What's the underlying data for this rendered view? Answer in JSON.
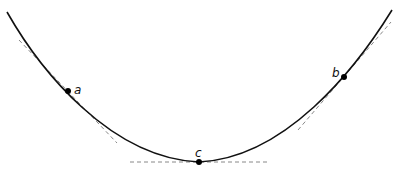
{
  "diagram": {
    "type": "convex-curve-with-tangents",
    "colors": {
      "curve": "#111111",
      "tangent": "#888888",
      "point": "#000000",
      "background": "#ffffff"
    },
    "points": [
      {
        "id": "a",
        "label": "a",
        "x": 68,
        "y": 91
      },
      {
        "id": "b",
        "label": "b",
        "x": 344,
        "y": 77
      },
      {
        "id": "c",
        "label": "c",
        "x": 199,
        "y": 162
      }
    ]
  }
}
